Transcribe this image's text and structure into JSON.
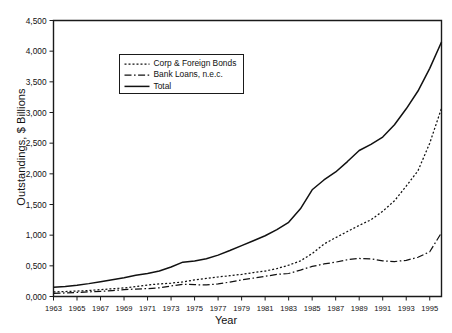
{
  "chart_data": {
    "type": "line",
    "title": "",
    "xlabel": "Year",
    "ylabel": "Outstandings, $ Billions",
    "grid": false,
    "legend_position": "upper-center-left",
    "xlim": [
      1963,
      1996
    ],
    "ylim": [
      0,
      4500
    ],
    "x_tick_labels": [
      "1963",
      "1965",
      "1967",
      "1969",
      "1971",
      "1973",
      "1975",
      "1977",
      "1979",
      "1981",
      "1983",
      "1985",
      "1987",
      "1989",
      "1991",
      "1993",
      "1995"
    ],
    "x_tick_values": [
      1963,
      1965,
      1967,
      1969,
      1971,
      1973,
      1975,
      1977,
      1979,
      1981,
      1983,
      1985,
      1987,
      1989,
      1991,
      1993,
      1995
    ],
    "y_tick_labels": [
      "0,000",
      "0,500",
      "1,000",
      "1,500",
      "2,000",
      "2,500",
      "3,000",
      "3,500",
      "4,000",
      "4,500"
    ],
    "y_tick_values": [
      0,
      500,
      1000,
      1500,
      2000,
      2500,
      3000,
      3500,
      4000,
      4500
    ],
    "x": [
      1963,
      1964,
      1965,
      1966,
      1967,
      1968,
      1969,
      1970,
      1971,
      1972,
      1973,
      1974,
      1975,
      1976,
      1977,
      1978,
      1979,
      1980,
      1981,
      1982,
      1983,
      1984,
      1985,
      1986,
      1987,
      1988,
      1989,
      1990,
      1991,
      1992,
      1993,
      1994,
      1995,
      1996
    ],
    "series": [
      {
        "name": "Corp & Foreign Bonds",
        "style": "dotted",
        "color": "#111111",
        "values": [
          75,
          80,
          88,
          98,
          112,
          126,
          140,
          162,
          188,
          205,
          218,
          238,
          270,
          295,
          318,
          340,
          360,
          390,
          415,
          455,
          510,
          580,
          700,
          855,
          960,
          1060,
          1160,
          1250,
          1390,
          1560,
          1800,
          2050,
          2500,
          3070
        ]
      },
      {
        "name": "Bank Loans, n.e.c.",
        "style": "dashdot",
        "color": "#111111",
        "values": [
          52,
          58,
          66,
          76,
          84,
          96,
          112,
          122,
          128,
          142,
          172,
          200,
          192,
          190,
          205,
          235,
          270,
          300,
          330,
          360,
          375,
          430,
          490,
          530,
          560,
          600,
          620,
          615,
          580,
          570,
          590,
          640,
          730,
          1040
        ]
      },
      {
        "name": "Total",
        "style": "solid",
        "color": "#111111",
        "values": [
          150,
          165,
          185,
          210,
          240,
          272,
          305,
          345,
          375,
          415,
          480,
          560,
          580,
          615,
          675,
          750,
          830,
          910,
          990,
          1090,
          1210,
          1430,
          1740,
          1900,
          2030,
          2200,
          2380,
          2480,
          2600,
          2800,
          3060,
          3350,
          3720,
          4150
        ]
      }
    ],
    "legend": [
      {
        "label": "Corp & Foreign Bonds",
        "style": "dotted"
      },
      {
        "label": "Bank Loans, n.e.c.",
        "style": "dashdot"
      },
      {
        "label": "Total",
        "style": "solid"
      }
    ]
  }
}
